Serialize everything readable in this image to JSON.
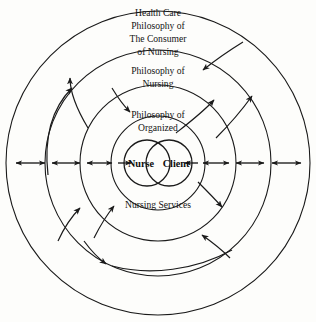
{
  "diagram": {
    "rings": [
      {
        "id": "ring-outer",
        "label_lines": [
          "Health Care",
          "Philosophy of",
          "The Consumer",
          "of Nursing"
        ],
        "radius": 152
      },
      {
        "id": "ring-second",
        "label_lines": [
          "Philosophy of",
          "Nursing"
        ],
        "radius": 113
      },
      {
        "id": "ring-third",
        "label_lines": [
          "Philosophy of",
          "Organized"
        ],
        "label_lines_lower": [
          "Nursing Services"
        ],
        "radius": 78
      },
      {
        "id": "ring-inner",
        "label_lines": [],
        "radius": 47
      }
    ],
    "core": {
      "left_label": "Nurse",
      "right_label": "Client",
      "radius": 23
    },
    "colors": {
      "stroke": "#1a1a1a",
      "background": "#fdfdfb",
      "text": "#141414"
    },
    "arrows": {
      "horizontal_count": 8,
      "curved_count": 10,
      "style": "double-headed bidirectional horizontal; single-headed curved along arcs"
    }
  }
}
